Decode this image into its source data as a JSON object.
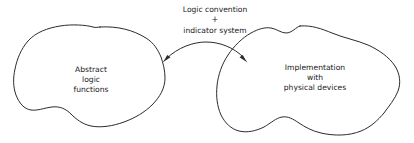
{
  "diagram": {
    "type": "two-region-relationship",
    "background_color": "#ffffff",
    "stroke_color": "#2b2b2b",
    "text_color": "#1a1a1a",
    "left_region": {
      "name": "abstract-logic-functions",
      "lines": [
        "Abstract",
        "logic",
        "functions"
      ]
    },
    "right_region": {
      "name": "implementation-with-physical-devices",
      "lines": [
        "Implementation",
        "with",
        "physical devices"
      ]
    },
    "connector": {
      "name": "bidirectional-mapping-arrow",
      "style": "curved double-headed arrow",
      "label_lines": [
        "Logic convention",
        "+",
        "indicator system"
      ]
    }
  }
}
